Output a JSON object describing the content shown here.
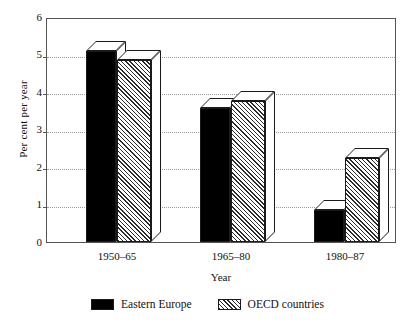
{
  "chart_data": {
    "type": "bar",
    "title": "",
    "xlabel": "Year",
    "ylabel": "Per cent per year",
    "categories": [
      "1950–65",
      "1965–80",
      "1980–87"
    ],
    "series": [
      {
        "name": "Eastern Europe",
        "values": [
          5.15,
          3.6,
          0.85
        ],
        "style": "solid-black"
      },
      {
        "name": "OECD countries",
        "values": [
          4.9,
          3.8,
          2.25
        ],
        "style": "hatched"
      }
    ],
    "ylim": [
      0,
      6
    ],
    "ytick_labels": [
      "0",
      "1",
      "2",
      "3",
      "4",
      "5",
      "6"
    ],
    "ytick_values": [
      0,
      1,
      2,
      3,
      4,
      5,
      6
    ],
    "grid": "horizontal-dotted",
    "legend_position": "bottom-center",
    "bar_style": "3d-extruded"
  },
  "axis": {
    "y_title": "Per cent per year",
    "x_title": "Year"
  },
  "legend": {
    "items": [
      {
        "label": "Eastern Europe",
        "swatch": "solid-black-swatch"
      },
      {
        "label": "OECD countries",
        "swatch": "hatched-swatch"
      }
    ]
  },
  "colors": {
    "series_1": "#000000",
    "series_2_hatch": "#2b2b2b",
    "axis": "#555555",
    "gridline": "#9a9a9a",
    "background": "#ffffff"
  }
}
